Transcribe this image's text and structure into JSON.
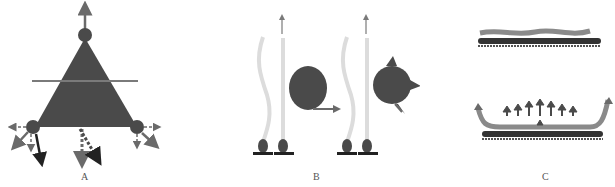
{
  "panels": [
    {
      "id": "A",
      "label": "A",
      "description": "Triangle with three corner nodes and force arrows"
    },
    {
      "id": "B",
      "label": "B",
      "description": "Cells on substrate with filaments and large spheres, arrows indicating motion"
    },
    {
      "id": "C",
      "label": "C",
      "description": "Wavy layer on substrate; bottom: curved sheet with upward arrows lifting from substrate"
    }
  ],
  "colors": {
    "shape_fill": "#4a4a4a",
    "arrow": "#6a6a6a",
    "dark_arrow": "#222222",
    "filament": "#d8d8d8",
    "line": "#808080",
    "substrate": "#222222",
    "sheet": "#8a8a8a"
  }
}
